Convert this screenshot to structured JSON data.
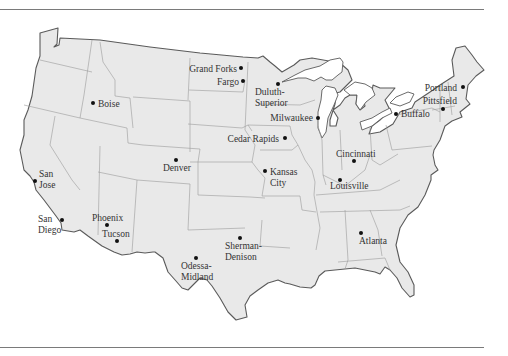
{
  "map": {
    "region": "Contiguous United States",
    "colors": {
      "land": "#e9e9e9",
      "outline": "#5a5a5a",
      "state_border": "#9a9a9a",
      "lake": "#ffffff",
      "dot": "#111111",
      "label": "#333333",
      "rule": "#7a7a7a"
    },
    "cities": [
      {
        "id": "grand-forks",
        "lines": [
          "Grand Forks"
        ],
        "dot": [
          241,
          68
        ],
        "label_anchor": "end",
        "label_pos": [
          237,
          72
        ]
      },
      {
        "id": "fargo",
        "lines": [
          "Fargo"
        ],
        "dot": [
          243,
          81
        ],
        "label_anchor": "end",
        "label_pos": [
          239,
          85
        ]
      },
      {
        "id": "duluth-superior",
        "lines": [
          "Duluth-",
          "Superior"
        ],
        "dot": [
          278,
          84
        ],
        "label_anchor": "start",
        "label_pos": [
          255,
          95
        ]
      },
      {
        "id": "boise",
        "lines": [
          "Boise"
        ],
        "dot": [
          93,
          103
        ],
        "label_anchor": "start",
        "label_pos": [
          98,
          107
        ]
      },
      {
        "id": "milwaukee",
        "lines": [
          "Milwaukee"
        ],
        "dot": [
          318,
          118
        ],
        "label_anchor": "end",
        "label_pos": [
          313,
          121
        ]
      },
      {
        "id": "buffalo",
        "lines": [
          "Buffalo"
        ],
        "dot": [
          396,
          114
        ],
        "label_anchor": "start",
        "label_pos": [
          401,
          117
        ]
      },
      {
        "id": "portland",
        "lines": [
          "Portland"
        ],
        "dot": [
          463,
          87
        ],
        "label_anchor": "end",
        "label_pos": [
          457,
          91
        ]
      },
      {
        "id": "pittsfield",
        "lines": [
          "Pittsfield"
        ],
        "dot": [
          443,
          109
        ],
        "label_anchor": "end",
        "label_pos": [
          457,
          104
        ]
      },
      {
        "id": "cedar-rapids",
        "lines": [
          "Cedar Rapids"
        ],
        "dot": [
          285,
          138
        ],
        "label_anchor": "end",
        "label_pos": [
          279,
          142
        ]
      },
      {
        "id": "cincinnati",
        "lines": [
          "Cincinnati"
        ],
        "dot": [
          354,
          161
        ],
        "label_anchor": "start",
        "label_pos": [
          336,
          157
        ]
      },
      {
        "id": "denver",
        "lines": [
          "Denver"
        ],
        "dot": [
          176,
          160
        ],
        "label_anchor": "start",
        "label_pos": [
          163,
          171
        ]
      },
      {
        "id": "kansas-city",
        "lines": [
          "Kansas",
          "City"
        ],
        "dot": [
          265,
          171
        ],
        "label_anchor": "start",
        "label_pos": [
          270,
          175
        ]
      },
      {
        "id": "louisville",
        "lines": [
          "Louisville"
        ],
        "dot": [
          340,
          180
        ],
        "label_anchor": "start",
        "label_pos": [
          330,
          189
        ]
      },
      {
        "id": "san-jose",
        "lines": [
          "San",
          "Jose"
        ],
        "dot": [
          35,
          181
        ],
        "label_anchor": "start",
        "label_pos": [
          39,
          177
        ]
      },
      {
        "id": "san-diego",
        "lines": [
          "San",
          "Diego"
        ],
        "dot": [
          62,
          220
        ],
        "label_anchor": "start",
        "label_pos": [
          38,
          222
        ]
      },
      {
        "id": "phoenix",
        "lines": [
          "Phoenix"
        ],
        "dot": [
          107,
          225
        ],
        "label_anchor": "start",
        "label_pos": [
          92,
          221
        ]
      },
      {
        "id": "tucson",
        "lines": [
          "Tucson"
        ],
        "dot": [
          117,
          241
        ],
        "label_anchor": "start",
        "label_pos": [
          102,
          237
        ]
      },
      {
        "id": "atlanta",
        "lines": [
          "Atlanta"
        ],
        "dot": [
          361,
          233
        ],
        "label_anchor": "start",
        "label_pos": [
          359,
          244
        ]
      },
      {
        "id": "sherman-denison",
        "lines": [
          "Sherman-",
          "Denison"
        ],
        "dot": [
          240,
          238
        ],
        "label_anchor": "start",
        "label_pos": [
          225,
          249
        ]
      },
      {
        "id": "odessa-midland",
        "lines": [
          "Odessa-",
          "Midland"
        ],
        "dot": [
          196,
          258
        ],
        "label_anchor": "start",
        "label_pos": [
          181,
          269
        ]
      }
    ]
  }
}
